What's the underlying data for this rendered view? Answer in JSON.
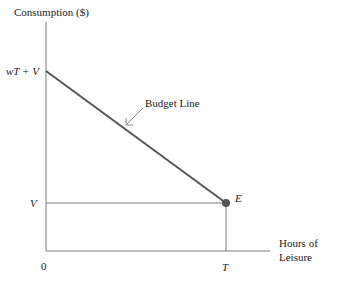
{
  "diagram": {
    "y_axis_label": "Consumption ($)",
    "x_axis_label_line1": "Hours of",
    "x_axis_label_line2": "Leisure",
    "y_tick_top": "wT + V",
    "y_tick_bottom": "V",
    "x_tick_origin": "0",
    "x_tick_end": "T",
    "budget_line_label": "Budget Line",
    "endowment_point_label": "E",
    "colors": {
      "axis": "#7a7a7a",
      "budget_line": "#555555",
      "point": "#555555",
      "text": "#222222"
    }
  }
}
